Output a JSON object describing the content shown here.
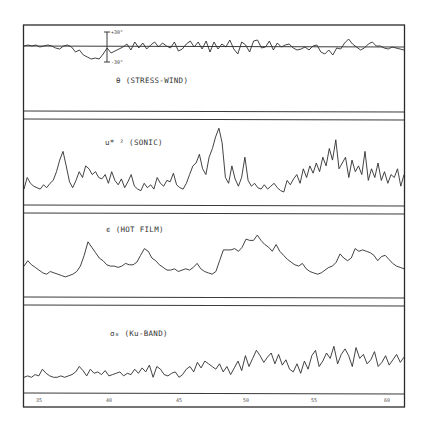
{
  "chart_data": {
    "type": "line",
    "title": "",
    "layout": "four vertically stacked strip-chart panels sharing a common time axis",
    "x": {
      "tick_labels": [
        "35",
        "40",
        "45",
        "50",
        "55",
        "60"
      ],
      "xlabel": ""
    },
    "grid": false,
    "legend": null,
    "panels": [
      {
        "name": "theta",
        "label": "θ (STRESS-WIND)",
        "scale_bar": {
          "top": "+30°",
          "bottom": "-30°"
        },
        "has_zero_line": true,
        "description": "Angle between stress and wind; oscillates about zero with a broad negative excursion near the scale bar",
        "values": [
          0,
          1,
          0,
          1,
          -1,
          0,
          1,
          0,
          -2,
          -3,
          0,
          1,
          -1,
          -6,
          -4,
          -9,
          -11,
          -13,
          -12,
          -13,
          -8,
          -2,
          -7,
          -5,
          -3,
          -1,
          2,
          -4,
          4,
          -2,
          3,
          -3,
          1,
          4,
          -1,
          3,
          0,
          -2,
          4,
          -5,
          -3,
          2,
          5,
          -1,
          4,
          -3,
          5,
          -6,
          4,
          -3,
          2,
          -1,
          6,
          -3,
          -8,
          4,
          1,
          -6,
          5,
          6,
          -2,
          -1,
          5,
          -4,
          3,
          -1,
          1,
          2,
          -2,
          -4,
          -3,
          -1,
          -4,
          0,
          1,
          -6,
          -8,
          -4,
          -9,
          -2,
          -3,
          3,
          7,
          2,
          -1,
          -4,
          -2,
          2,
          4,
          0,
          0,
          -2,
          -3,
          -1,
          -2,
          -3,
          -4
        ]
      },
      {
        "name": "u_star_squared",
        "label": "u* ² (SONIC)",
        "description": "Friction velocity squared from sonic anemometer; spiky, peaks near 41, 50 and 57",
        "values": [
          2,
          10,
          6,
          4,
          3,
          2,
          5,
          3,
          6,
          8,
          14,
          22,
          28,
          18,
          7,
          3,
          8,
          14,
          10,
          18,
          16,
          12,
          14,
          10,
          9,
          12,
          6,
          14,
          8,
          5,
          9,
          3,
          7,
          12,
          4,
          2,
          1,
          6,
          3,
          5,
          2,
          10,
          6,
          4,
          8,
          7,
          13,
          5,
          3,
          2,
          6,
          12,
          18,
          20,
          26,
          16,
          12,
          24,
          30,
          38,
          44,
          34,
          10,
          6,
          18,
          9,
          4,
          10,
          24,
          8,
          4,
          6,
          3,
          2,
          5,
          2,
          4,
          6,
          3,
          1,
          0,
          8,
          5,
          9,
          12,
          6,
          16,
          10,
          18,
          13,
          20,
          14,
          24,
          18,
          30,
          22,
          36,
          16,
          20,
          24,
          10,
          22,
          14,
          18,
          12,
          28,
          8,
          16,
          10,
          20,
          8,
          14,
          6,
          12,
          10,
          16,
          4,
          12
        ]
      },
      {
        "name": "epsilon",
        "label": "ϵ (HOT FILM)",
        "description": "Dissipation rate from hot-film probe; slowly varying with broad maxima near 40, 44 and 50",
        "values": [
          14,
          18,
          15,
          13,
          11,
          9,
          8,
          10,
          9,
          8,
          7,
          6,
          7,
          8,
          10,
          14,
          22,
          32,
          28,
          24,
          20,
          18,
          15,
          14,
          14,
          13,
          14,
          16,
          15,
          15,
          17,
          22,
          27,
          25,
          20,
          18,
          15,
          13,
          11,
          11,
          12,
          10,
          11,
          12,
          11,
          13,
          16,
          12,
          10,
          9,
          8,
          10,
          18,
          26,
          26,
          26,
          27,
          25,
          28,
          34,
          33,
          33,
          37,
          33,
          30,
          28,
          25,
          30,
          25,
          22,
          19,
          17,
          15,
          14,
          16,
          12,
          10,
          9,
          8,
          9,
          11,
          13,
          14,
          17,
          23,
          20,
          18,
          20,
          27,
          25,
          26,
          25,
          24,
          22,
          18,
          21,
          22,
          19,
          16,
          14,
          13,
          12
        ]
      },
      {
        "name": "sigma_0_ku_band",
        "label": "σ₀ (Ku-BAND)",
        "description": "Ku-band radar backscatter; low-level noise before ~45, higher and more variable after ~47",
        "values": [
          2,
          3,
          2,
          4,
          3,
          8,
          5,
          3,
          2,
          2,
          3,
          2,
          3,
          4,
          6,
          10,
          7,
          3,
          8,
          5,
          6,
          4,
          7,
          3,
          4,
          5,
          6,
          3,
          5,
          4,
          8,
          5,
          9,
          6,
          11,
          2,
          10,
          8,
          4,
          3,
          5,
          6,
          2,
          4,
          8,
          10,
          6,
          13,
          9,
          14,
          12,
          10,
          8,
          12,
          6,
          10,
          4,
          9,
          14,
          7,
          18,
          10,
          16,
          22,
          18,
          13,
          17,
          20,
          12,
          19,
          11,
          15,
          8,
          6,
          12,
          5,
          14,
          8,
          18,
          22,
          10,
          14,
          20,
          16,
          25,
          12,
          19,
          23,
          18,
          10,
          24,
          16,
          19,
          12,
          15,
          21,
          10,
          13,
          18,
          11,
          15,
          19,
          13,
          17
        ]
      }
    ]
  }
}
